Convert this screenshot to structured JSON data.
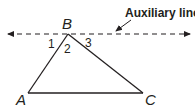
{
  "diagram": {
    "type": "geometry-triangle-auxiliary-line",
    "colors": {
      "stroke": "#231f20",
      "background": "#ffffff"
    },
    "vertices": {
      "A": {
        "label": "A",
        "x": 28,
        "y": 93
      },
      "B": {
        "label": "B",
        "x": 68,
        "y": 34
      },
      "C": {
        "label": "C",
        "x": 143,
        "y": 93
      }
    },
    "angles": [
      {
        "label": "1"
      },
      {
        "label": "2"
      },
      {
        "label": "3"
      }
    ],
    "auxiliary_line": {
      "label": "Auxiliary line",
      "style": "dashed",
      "arrows": "both-ends",
      "parallel_to": "AC",
      "through": "B"
    }
  }
}
